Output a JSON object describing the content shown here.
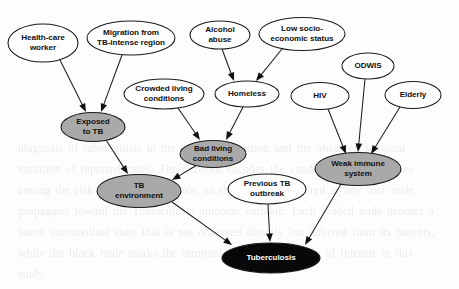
{
  "figure": {
    "type": "directed-graph",
    "title": "",
    "canvas": {
      "width": 459,
      "height": 289
    },
    "style": {
      "background": "#fdfdfc",
      "node_stroke": "#1a1a1a",
      "edge_stroke": "#1d1d1d",
      "fill_root": "#ffffff",
      "fill_intermediate": "#a9a9a9",
      "fill_outcome": "#080808",
      "label_color": "#111111",
      "label_color_on_dark": "#ffffff"
    },
    "legend_note": "",
    "bleed_text": "diagnosis of tuberculosis in the patient population and the observed seasonal variation of reported cases. The network encodes the conditional dependencies among the risk factors listed above, so that evidence entered at any root node propagates toward the Tuberculosis outcome variable. Each shaded node denotes a latent intermediate state that is not observed directly but inferred from its parents, while the black node marks the terminal diagnostic variable of interest in this study."
  },
  "nodes": [
    {
      "id": "health_care_worker",
      "label": "Health-care\nworker",
      "cx": 43,
      "cy": 43,
      "rx": 35,
      "ry": 19,
      "fill": "white",
      "role": "root"
    },
    {
      "id": "migration",
      "label": "Migration from\nTB-intense region",
      "cx": 131,
      "cy": 38,
      "rx": 44,
      "ry": 17,
      "fill": "white",
      "role": "root"
    },
    {
      "id": "alcohol_abuse",
      "label": "Alcohol\nabuse",
      "cx": 220,
      "cy": 35,
      "rx": 30,
      "ry": 14,
      "fill": "white",
      "role": "root"
    },
    {
      "id": "low_socio",
      "label": "Low socio-\neconomic status",
      "cx": 302,
      "cy": 34,
      "rx": 43,
      "ry": 16.5,
      "fill": "white",
      "role": "root"
    },
    {
      "id": "odwis",
      "label": "ODWIS",
      "cx": 368,
      "cy": 66,
      "rx": 26,
      "ry": 13,
      "fill": "white",
      "role": "root"
    },
    {
      "id": "hiv",
      "label": "HIV",
      "cx": 320,
      "cy": 96,
      "rx": 29,
      "ry": 13.5,
      "fill": "white",
      "role": "root"
    },
    {
      "id": "elderly",
      "label": "Elderly",
      "cx": 413,
      "cy": 95,
      "rx": 28,
      "ry": 13.5,
      "fill": "white",
      "role": "root"
    },
    {
      "id": "crowded_living",
      "label": "Crowded living\nconditions",
      "cx": 164,
      "cy": 94,
      "rx": 40,
      "ry": 15,
      "fill": "white",
      "role": "root"
    },
    {
      "id": "homeless",
      "label": "Homeless",
      "cx": 247,
      "cy": 94,
      "rx": 32,
      "ry": 13,
      "fill": "white",
      "role": "intermediate-white"
    },
    {
      "id": "exposed_to_tb",
      "label": "Exposed\nto TB",
      "cx": 93,
      "cy": 127,
      "rx": 32,
      "ry": 14.5,
      "fill": "gray",
      "role": "intermediate"
    },
    {
      "id": "bad_living",
      "label": "Bad living\nconditions",
      "cx": 213,
      "cy": 154,
      "rx": 33,
      "ry": 13.5,
      "fill": "gray",
      "role": "intermediate"
    },
    {
      "id": "tb_environment",
      "label": "TB\nenvironment",
      "cx": 139,
      "cy": 191,
      "rx": 42,
      "ry": 16.5,
      "fill": "gray",
      "role": "intermediate"
    },
    {
      "id": "weak_immune",
      "label": "Weak immune\nsystem",
      "cx": 358,
      "cy": 169,
      "rx": 43,
      "ry": 16.5,
      "fill": "gray",
      "role": "intermediate"
    },
    {
      "id": "previous_tb",
      "label": "Previous TB\noutbreak",
      "cx": 267,
      "cy": 189,
      "rx": 39,
      "ry": 15,
      "fill": "white",
      "role": "root"
    },
    {
      "id": "tuberculosis",
      "label": "Tuberculosis",
      "cx": 271,
      "cy": 258,
      "rx": 49,
      "ry": 15,
      "fill": "black",
      "role": "outcome"
    }
  ],
  "edges": [
    {
      "from": "health_care_worker",
      "to": "exposed_to_tb",
      "x1": 60,
      "y1": 60,
      "x2": 86,
      "y2": 112
    },
    {
      "from": "migration",
      "to": "exposed_to_tb",
      "x1": 122,
      "y1": 55,
      "x2": 101,
      "y2": 112
    },
    {
      "from": "alcohol_abuse",
      "to": "homeless",
      "x1": 222,
      "y1": 49,
      "x2": 234,
      "y2": 81
    },
    {
      "from": "low_socio",
      "to": "homeless",
      "x1": 282,
      "y1": 49,
      "x2": 256,
      "y2": 81
    },
    {
      "from": "crowded_living",
      "to": "bad_living",
      "x1": 178,
      "y1": 108,
      "x2": 200,
      "y2": 140
    },
    {
      "from": "homeless",
      "to": "bad_living",
      "x1": 243,
      "y1": 107,
      "x2": 226,
      "y2": 140
    },
    {
      "from": "exposed_to_tb",
      "to": "tb_environment",
      "x1": 106,
      "y1": 140,
      "x2": 128,
      "y2": 174
    },
    {
      "from": "bad_living",
      "to": "tb_environment",
      "x1": 197,
      "y1": 165,
      "x2": 172,
      "y2": 180
    },
    {
      "from": "hiv",
      "to": "weak_immune",
      "x1": 328,
      "y1": 109,
      "x2": 346,
      "y2": 154
    },
    {
      "from": "odwis",
      "to": "weak_immune",
      "x1": 365,
      "y1": 79,
      "x2": 358,
      "y2": 152
    },
    {
      "from": "elderly",
      "to": "weak_immune",
      "x1": 400,
      "y1": 107,
      "x2": 371,
      "y2": 154
    },
    {
      "from": "tb_environment",
      "to": "tuberculosis",
      "x1": 172,
      "y1": 202,
      "x2": 232,
      "y2": 245
    },
    {
      "from": "previous_tb",
      "to": "tuberculosis",
      "x1": 268,
      "y1": 204,
      "x2": 270,
      "y2": 242
    },
    {
      "from": "weak_immune",
      "to": "tuberculosis",
      "x1": 341,
      "y1": 184,
      "x2": 305,
      "y2": 245
    }
  ]
}
